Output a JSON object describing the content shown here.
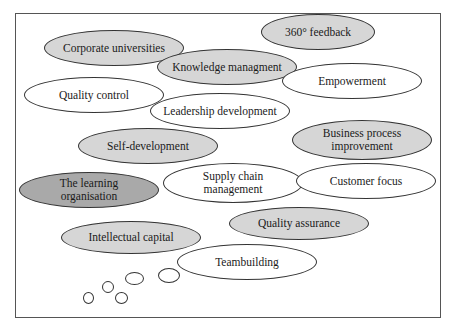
{
  "diagram": {
    "type": "thought-cloud",
    "concepts": [
      {
        "label": "Corporate universities",
        "shade": "light",
        "x": 44,
        "y": 30,
        "w": 140,
        "h": 36
      },
      {
        "label": "360° feedback",
        "shade": "light",
        "x": 261,
        "y": 14,
        "w": 114,
        "h": 36
      },
      {
        "label": "Knowledge managment",
        "shade": "light",
        "x": 157,
        "y": 49,
        "w": 140,
        "h": 36
      },
      {
        "label": "Empowerment",
        "shade": "white",
        "x": 282,
        "y": 63,
        "w": 140,
        "h": 36
      },
      {
        "label": "Quality control",
        "shade": "white",
        "x": 24,
        "y": 77,
        "w": 140,
        "h": 36
      },
      {
        "label": "Leadership development",
        "shade": "white",
        "x": 150,
        "y": 93,
        "w": 140,
        "h": 36
      },
      {
        "label": "Self-development",
        "shade": "light",
        "x": 78,
        "y": 128,
        "w": 140,
        "h": 36
      },
      {
        "label": "Business process improvement",
        "shade": "light",
        "x": 292,
        "y": 120,
        "w": 140,
        "h": 40
      },
      {
        "label": "The learning organisation",
        "shade": "dark",
        "x": 19,
        "y": 172,
        "w": 140,
        "h": 36
      },
      {
        "label": "Supply chain management",
        "shade": "white",
        "x": 163,
        "y": 163,
        "w": 140,
        "h": 40
      },
      {
        "label": "Customer focus",
        "shade": "white",
        "x": 296,
        "y": 163,
        "w": 140,
        "h": 36
      },
      {
        "label": "Quality assurance",
        "shade": "light",
        "x": 229,
        "y": 207,
        "w": 140,
        "h": 33
      },
      {
        "label": "Intellectual capital",
        "shade": "light",
        "x": 61,
        "y": 221,
        "w": 140,
        "h": 33
      },
      {
        "label": "Teambuilding",
        "shade": "white",
        "x": 177,
        "y": 244,
        "w": 140,
        "h": 36
      }
    ],
    "thought_bubbles": [
      {
        "x": 158,
        "y": 268,
        "w": 22,
        "h": 15
      },
      {
        "x": 125,
        "y": 272,
        "w": 19,
        "h": 13
      },
      {
        "x": 102,
        "y": 281,
        "w": 12,
        "h": 12
      },
      {
        "x": 115,
        "y": 292,
        "w": 13,
        "h": 12
      },
      {
        "x": 83,
        "y": 292,
        "w": 11,
        "h": 12
      }
    ]
  }
}
